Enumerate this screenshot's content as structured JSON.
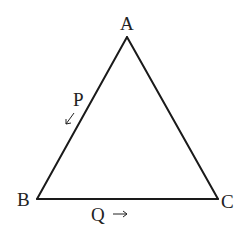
{
  "diagram": {
    "type": "geometry",
    "shape": "triangle",
    "stroke_color": "#1a1a1a",
    "vertices": [
      {
        "name": "A",
        "label": "A",
        "x": 127,
        "y": 37
      },
      {
        "name": "B",
        "label": "B",
        "x": 37,
        "y": 199
      },
      {
        "name": "C",
        "label": "C",
        "x": 218,
        "y": 199
      }
    ],
    "moving_points": [
      {
        "name": "P",
        "label": "P",
        "on_side": "AB",
        "direction": "toward B",
        "arrow": "↙"
      },
      {
        "name": "Q",
        "label": "Q",
        "on_side": "BC",
        "direction": "toward C",
        "arrow": "→"
      }
    ]
  }
}
